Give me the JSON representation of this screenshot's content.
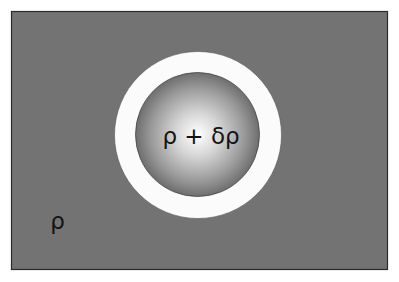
{
  "diagram": {
    "background_region": {
      "label": "ρ",
      "color": "#727272"
    },
    "shell": {
      "color": "#ffffff"
    },
    "inner_region": {
      "label": "ρ + δρ",
      "center_color": "#ffffff",
      "edge_color": "#6a6a6a"
    }
  }
}
